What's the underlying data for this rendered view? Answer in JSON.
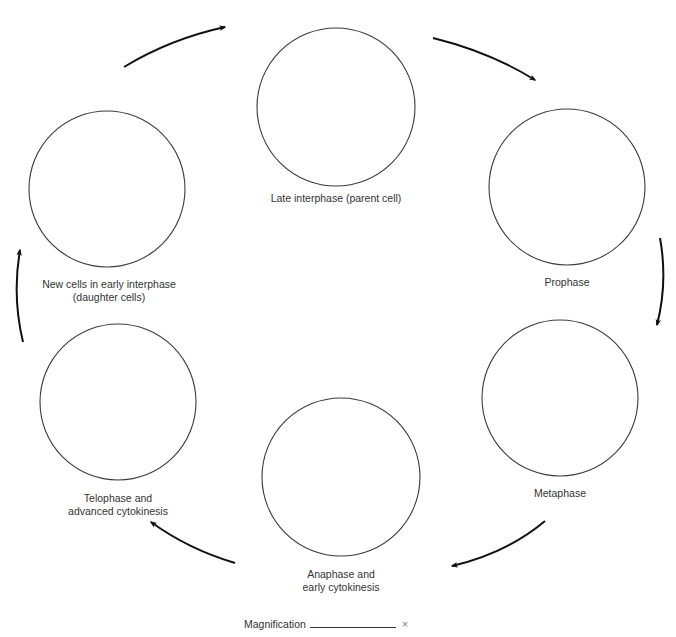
{
  "diagram": {
    "stages": [
      {
        "id": "late-interphase",
        "label_lines": [
          "Late interphase (parent cell)"
        ],
        "cx": 336,
        "cy": 107,
        "r": 79,
        "label_x": 336,
        "label_y": 192
      },
      {
        "id": "prophase",
        "label_lines": [
          "Prophase"
        ],
        "cx": 567,
        "cy": 187,
        "r": 78,
        "label_x": 567,
        "label_y": 276
      },
      {
        "id": "metaphase",
        "label_lines": [
          "Metaphase"
        ],
        "cx": 560,
        "cy": 398,
        "r": 78,
        "label_x": 560,
        "label_y": 487
      },
      {
        "id": "anaphase",
        "label_lines": [
          "Anaphase and",
          "early cytokinesis"
        ],
        "cx": 341,
        "cy": 477,
        "r": 79,
        "label_x": 341,
        "label_y": 568
      },
      {
        "id": "telophase",
        "label_lines": [
          "Telophase and",
          "advanced cytokinesis"
        ],
        "cx": 118,
        "cy": 402,
        "r": 78,
        "label_x": 118,
        "label_y": 492
      },
      {
        "id": "new-cells",
        "label_lines": [
          "New cells in early interphase",
          "(daughter cells)"
        ],
        "cx": 107,
        "cy": 189,
        "r": 78,
        "label_x": 109,
        "label_y": 278
      }
    ],
    "arrows": [
      {
        "id": "arrow-late-interphase-to-prophase",
        "d": "M433,38 Q490,52 535,80"
      },
      {
        "id": "arrow-prophase-to-metaphase",
        "d": "M660,238 Q668,282 657,325"
      },
      {
        "id": "arrow-metaphase-to-anaphase",
        "d": "M545,521 Q507,553 452,566"
      },
      {
        "id": "arrow-anaphase-to-telophase",
        "d": "M235,563 Q188,549 151,522"
      },
      {
        "id": "arrow-telophase-to-new-cells",
        "d": "M23,342 Q12,296 20,250"
      },
      {
        "id": "arrow-new-cells-to-late-interphase",
        "d": "M124,67 Q170,39 225,27"
      }
    ],
    "colors": {
      "circle_stroke": "#3a3a3a",
      "arrow": "#111111",
      "text": "#333333"
    }
  },
  "magnification": {
    "label": "Magnification",
    "value": "",
    "suffix": "×"
  }
}
